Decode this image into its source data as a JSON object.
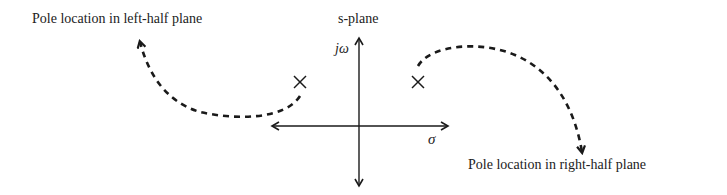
{
  "diagram": {
    "title": "s-plane",
    "axes": {
      "vertical_label": "jω",
      "horizontal_label": "σ"
    },
    "poles": [
      {
        "name": "left-pole",
        "symbol": "×",
        "x": 300,
        "y": 82
      },
      {
        "name": "right-pole",
        "symbol": "×",
        "x": 418,
        "y": 82
      }
    ],
    "annotations": {
      "left": "Pole location in left-half plane",
      "right": "Pole location in right-half plane"
    },
    "colors": {
      "ink": "#1a1a1a"
    }
  }
}
